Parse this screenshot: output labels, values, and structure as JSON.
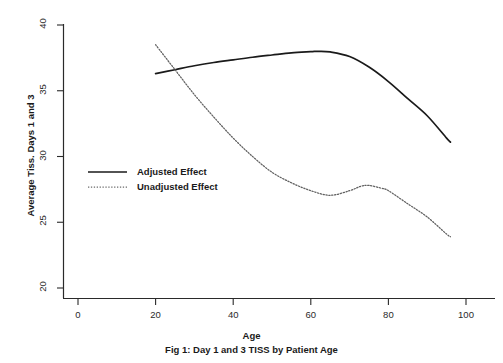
{
  "chart_data": {
    "type": "line",
    "title": "",
    "caption": "Fig 1: Day 1 and 3 TISS by Patient Age",
    "xlabel": "Age",
    "ylabel": "Average Tiss. Days 1 and 3",
    "xlim": [
      0,
      105
    ],
    "ylim": [
      19.3,
      40.8
    ],
    "xticks": [
      0,
      20,
      40,
      60,
      80,
      100
    ],
    "yticks": [
      20,
      25,
      30,
      35,
      40
    ],
    "xtick_labels": [
      "0",
      "20",
      "40",
      "60",
      "80",
      "100"
    ],
    "ytick_labels": [
      "20",
      "25",
      "30",
      "35",
      "40"
    ],
    "grid": false,
    "legend_position": "center-left",
    "series": [
      {
        "name": "Adjusted Effect",
        "style": "solid",
        "color": "#1a1a1a",
        "x": [
          20,
          25,
          30,
          35,
          40,
          45,
          50,
          55,
          60,
          62,
          65,
          70,
          75,
          80,
          85,
          90,
          95,
          96
        ],
        "y": [
          36.3,
          36.6,
          36.9,
          37.15,
          37.35,
          37.55,
          37.72,
          37.88,
          37.97,
          38.0,
          37.95,
          37.6,
          36.8,
          35.7,
          34.4,
          33.1,
          31.4,
          31.1
        ]
      },
      {
        "name": "Unadjusted Effect",
        "style": "dotted",
        "color": "#5a5a5a",
        "x": [
          20,
          25,
          30,
          35,
          40,
          45,
          50,
          55,
          60,
          65,
          70,
          73,
          75,
          78,
          80,
          85,
          90,
          95,
          96
        ],
        "y": [
          38.5,
          36.6,
          34.7,
          33.0,
          31.4,
          30.0,
          28.8,
          28.0,
          27.4,
          27.05,
          27.4,
          27.75,
          27.8,
          27.6,
          27.4,
          26.4,
          25.4,
          24.1,
          23.9
        ]
      }
    ]
  },
  "legend": {
    "entries": [
      {
        "label": "Adjusted Effect",
        "style": "solid"
      },
      {
        "label": "Unadjusted Effect",
        "style": "dotted"
      }
    ]
  }
}
